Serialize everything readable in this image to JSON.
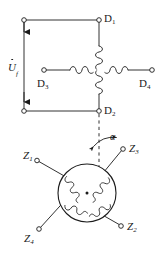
{
  "figure": {
    "kind": "electrical-schematic",
    "background_color": "#ffffff",
    "line_color": "#1b1b1b",
    "text_color": "#1b1b1b"
  },
  "stator": {
    "terminals": [
      {
        "id": "D1",
        "label": "D",
        "subscript": "1"
      },
      {
        "id": "D2",
        "label": "D",
        "subscript": "2"
      },
      {
        "id": "D3",
        "label": "D",
        "subscript": "3"
      },
      {
        "id": "D4",
        "label": "D",
        "subscript": "4"
      }
    ],
    "coil_count": 4
  },
  "rotor": {
    "terminals": [
      {
        "id": "Z1",
        "label": "Z",
        "subscript": "1"
      },
      {
        "id": "Z2",
        "label": "Z",
        "subscript": "2"
      },
      {
        "id": "Z3",
        "label": "Z",
        "subscript": "3"
      },
      {
        "id": "Z4",
        "label": "Z",
        "subscript": "4"
      }
    ],
    "coil_count": 4
  },
  "source": {
    "symbol": "U",
    "subscript": "f",
    "notation": "phasor-dot",
    "arrow_direction": "down"
  },
  "angle": {
    "symbol": "α",
    "reference": "dashed-vertical-axis"
  }
}
